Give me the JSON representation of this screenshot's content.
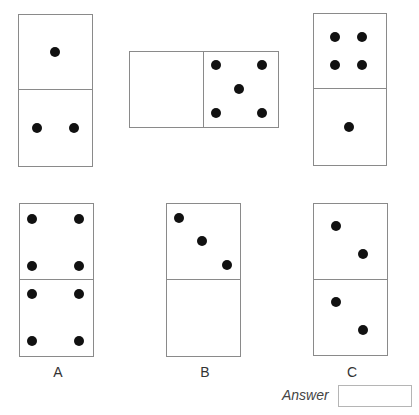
{
  "puzzle": {
    "question_dominoes": [
      {
        "id": "q1",
        "orientation": "vertical",
        "halves": [
          1,
          2
        ]
      },
      {
        "id": "q2",
        "orientation": "horizontal",
        "halves": [
          0,
          5
        ]
      },
      {
        "id": "q3",
        "orientation": "vertical",
        "halves": [
          4,
          1
        ]
      }
    ],
    "options": [
      {
        "label": "A",
        "halves": [
          4,
          4
        ]
      },
      {
        "label": "B",
        "halves": [
          3,
          0
        ]
      },
      {
        "label": "C",
        "halves": [
          2,
          2
        ]
      }
    ]
  },
  "answer": {
    "label": "Answer",
    "value": ""
  },
  "colors": {
    "pip": "#111111",
    "border": "#8a8a8a"
  }
}
